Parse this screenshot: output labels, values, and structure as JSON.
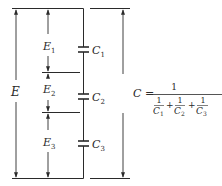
{
  "diagram": {
    "colors": {
      "ink": "#2a2a2a",
      "background": "#ffffff"
    },
    "labels": {
      "total_voltage": "E",
      "voltages": [
        {
          "symbol": "E",
          "sub": "1"
        },
        {
          "symbol": "E",
          "sub": "2"
        },
        {
          "symbol": "E",
          "sub": "3"
        }
      ],
      "capacitors": [
        {
          "symbol": "C",
          "sub": "1"
        },
        {
          "symbol": "C",
          "sub": "2"
        },
        {
          "symbol": "C",
          "sub": "3"
        }
      ]
    },
    "formula": {
      "lhs": "C =",
      "numerator": "1",
      "terms": [
        {
          "num": "1",
          "den_symbol": "C",
          "den_sub": "1"
        },
        {
          "num": "1",
          "den_symbol": "C",
          "den_sub": "2"
        },
        {
          "num": "1",
          "den_symbol": "C",
          "den_sub": "3"
        }
      ],
      "plus": "+"
    }
  }
}
